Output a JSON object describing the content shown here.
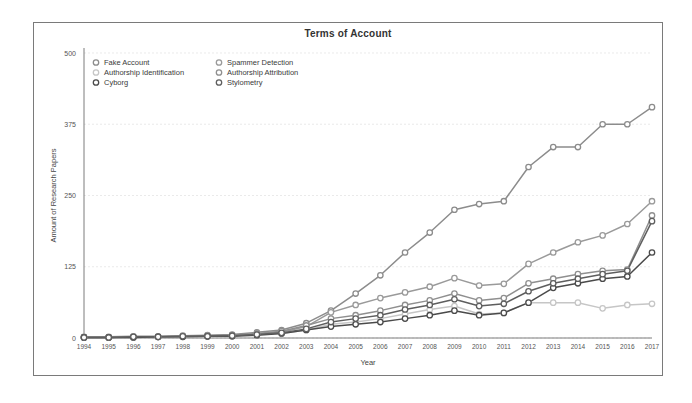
{
  "figure": {
    "title": "Terms of Account",
    "border_color": "#7a7a7a",
    "background": "#ffffff"
  },
  "axes": {
    "xlabel": "Year",
    "ylabel": "Amount of Research Papers",
    "yticks": [
      "0",
      "125",
      "250",
      "375",
      "500"
    ],
    "xticks": [
      "1994",
      "1995",
      "1996",
      "1997",
      "1998",
      "1999",
      "2000",
      "2001",
      "2002",
      "2003",
      "2004",
      "2005",
      "2006",
      "2007",
      "2008",
      "2009",
      "2010",
      "2011",
      "2012",
      "2013",
      "2014",
      "2015",
      "2016",
      "2017"
    ]
  },
  "legend": {
    "position": "top-left",
    "entries": [
      {
        "label": "Fake Account",
        "color": "#8c8c8c",
        "marker": "circle"
      },
      {
        "label": "Spammer Detection",
        "color": "#9a9a9a",
        "marker": "circle"
      },
      {
        "label": "Authorship Identification",
        "color": "#c6c6c6",
        "marker": "circle"
      },
      {
        "label": "Authorship Attribution",
        "color": "#8f8f8f",
        "marker": "circle"
      },
      {
        "label": "Cyborg",
        "color": "#4a4a4a",
        "marker": "circle"
      },
      {
        "label": "Stylometry",
        "color": "#5e5e5e",
        "marker": "circle"
      }
    ]
  },
  "chart_data": {
    "type": "line",
    "title": "Terms of Account",
    "xlabel": "Year",
    "ylabel": "Amount of Research Papers",
    "xlim": [
      1994,
      2017
    ],
    "ylim": [
      0,
      500
    ],
    "yticks": [
      0,
      125,
      250,
      375,
      500
    ],
    "grid": true,
    "legend_position": "top-left",
    "categories": [
      1994,
      1995,
      1996,
      1997,
      1998,
      1999,
      2000,
      2001,
      2002,
      2003,
      2004,
      2005,
      2006,
      2007,
      2008,
      2009,
      2010,
      2011,
      2012,
      2013,
      2014,
      2015,
      2016,
      2017
    ],
    "series": [
      {
        "name": "Fake Account",
        "color": "#8c8c8c",
        "values": [
          2,
          2,
          3,
          3,
          4,
          5,
          6,
          10,
          14,
          26,
          48,
          78,
          110,
          150,
          185,
          225,
          235,
          240,
          300,
          335,
          335,
          375,
          375,
          405
        ]
      },
      {
        "name": "Spammer Detection",
        "color": "#9a9a9a",
        "values": [
          1,
          1,
          2,
          2,
          3,
          3,
          4,
          7,
          10,
          20,
          45,
          58,
          70,
          80,
          90,
          105,
          92,
          95,
          130,
          150,
          168,
          180,
          200,
          240
        ]
      },
      {
        "name": "Authorship Identification",
        "color": "#c6c6c6",
        "values": [
          1,
          1,
          1,
          2,
          2,
          3,
          4,
          6,
          8,
          14,
          24,
          28,
          34,
          42,
          50,
          56,
          42,
          44,
          62,
          62,
          62,
          52,
          58,
          60
        ]
      },
      {
        "name": "Authorship Attribution",
        "color": "#8f8f8f",
        "values": [
          1,
          1,
          2,
          2,
          3,
          4,
          5,
          8,
          12,
          22,
          34,
          40,
          48,
          58,
          66,
          78,
          66,
          70,
          96,
          104,
          112,
          118,
          120,
          215
        ]
      },
      {
        "name": "Cyborg",
        "color": "#4a4a4a",
        "values": [
          1,
          1,
          1,
          2,
          2,
          3,
          3,
          5,
          8,
          14,
          20,
          24,
          28,
          34,
          40,
          48,
          40,
          44,
          62,
          88,
          96,
          104,
          108,
          150
        ]
      },
      {
        "name": "Stylometry",
        "color": "#5e5e5e",
        "values": [
          1,
          1,
          2,
          2,
          3,
          3,
          4,
          6,
          9,
          16,
          28,
          34,
          40,
          50,
          58,
          68,
          56,
          60,
          82,
          96,
          104,
          112,
          118,
          205
        ]
      }
    ]
  }
}
